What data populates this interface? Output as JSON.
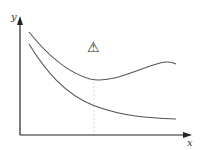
{
  "diagram": {
    "axes": {
      "x_label": "x",
      "y_label": "y"
    },
    "curves": [
      {
        "name": "upper-curve",
        "description": "decreasing then rising curve with minimum near middle"
      },
      {
        "name": "lower-curve",
        "description": "monotonically decreasing curve flattening out"
      }
    ],
    "marker": {
      "icon": "warning-icon",
      "glyph": "⚠"
    },
    "guide_line": "dotted vertical line at curve minimum",
    "colors": {
      "axis": "#222222",
      "curve": "#555555",
      "guide": "#dddddd"
    }
  }
}
